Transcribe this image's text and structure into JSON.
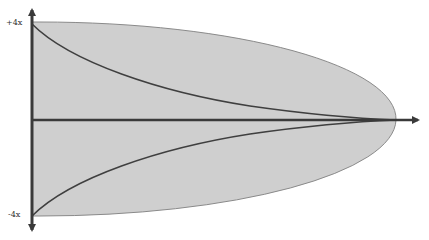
{
  "diagram": {
    "axis_labels": {
      "top": "+4x",
      "bottom": "-4x"
    },
    "colors": {
      "fill": "#cfcfcf",
      "fill_edge": "#8a8a8a",
      "axis": "#3a3a3a",
      "curve": "#3f3f3f",
      "label": "#333333"
    },
    "shape": {
      "type": "half-ellipse",
      "left_x": 32,
      "right_tip_x": 396,
      "center_y": 120,
      "top_y": 22,
      "bottom_y": 216
    },
    "curves": [
      {
        "name": "upper-curve",
        "from": [
          32,
          22
        ],
        "to": [
          396,
          120
        ]
      },
      {
        "name": "lower-curve",
        "from": [
          32,
          216
        ],
        "to": [
          396,
          120
        ]
      }
    ]
  }
}
